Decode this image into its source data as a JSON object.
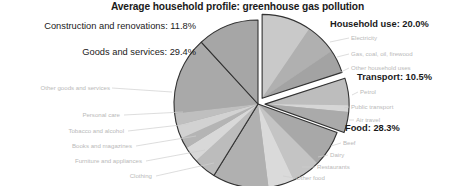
{
  "chart_data": {
    "type": "pie",
    "title": "Average household profile: greenhouse gas pollution",
    "xlabel": "",
    "ylabel": "",
    "legend_position": "none",
    "grid": false,
    "units": "percent",
    "categories": [
      "Household use",
      "Transport",
      "Food",
      "Goods and services",
      "Construction and renovations"
    ],
    "values": [
      20.0,
      10.5,
      28.3,
      29.4,
      11.8
    ],
    "slices": [
      {
        "name": "Household use",
        "label": "Household use: 20.0%",
        "value": 20.0,
        "exploded": true,
        "color": "#b8b8b8",
        "sub": [
          {
            "name": "Electricity",
            "label": "Electricity",
            "value": 9.5,
            "color": "#c9c9c9"
          },
          {
            "name": "Gas, coal, oil, firewood",
            "label": "Gas, coal, oil, firewood",
            "value": 6.0,
            "color": "#b0b0b0"
          },
          {
            "name": "Other household uses",
            "label": "Other household uses",
            "value": 4.5,
            "color": "#a3a3a3"
          }
        ]
      },
      {
        "name": "Transport",
        "label": "Transport: 10.5%",
        "value": 10.5,
        "exploded": true,
        "color": "#b4b4b4",
        "sub": [
          {
            "name": "Petrol",
            "label": "Petrol",
            "value": 5.2,
            "color": "#bdbdbd"
          },
          {
            "name": "Public transport",
            "label": "Public transport",
            "value": 1.3,
            "color": "#d6d6d6"
          },
          {
            "name": "Air travel",
            "label": "Air travel",
            "value": 4.0,
            "color": "#aaaaaa"
          }
        ]
      },
      {
        "name": "Food",
        "label": "Food: 28.3%",
        "value": 28.3,
        "exploded": false,
        "color": "#b2b2b2",
        "sub": [
          {
            "name": "Beef",
            "label": "Beef",
            "value": 7.0,
            "color": "#a8a8a8"
          },
          {
            "name": "Dairy",
            "label": "Dairy",
            "value": 5.5,
            "color": "#c4c4c4"
          },
          {
            "name": "Restaurants",
            "label": "Restaurants",
            "value": 5.0,
            "color": "#dadada"
          },
          {
            "name": "Other food",
            "label": "Other food",
            "value": 10.8,
            "color": "#b0b0b0"
          }
        ]
      },
      {
        "name": "Goods and services",
        "label": "Goods and services: 29.4%",
        "value": 29.4,
        "exploded": false,
        "color": "#aeaeae",
        "sub": [
          {
            "name": "Clothing",
            "label": "Clothing",
            "value": 4.4,
            "color": "#bcbcbc"
          },
          {
            "name": "Furniture and appliances",
            "label": "Furniture and appliances",
            "value": 3.0,
            "color": "#d8d8d8"
          },
          {
            "name": "Books and magazines",
            "label": "Books and magazines",
            "value": 2.1,
            "color": "#b4b4b4"
          },
          {
            "name": "Tobacco and alcohol",
            "label": "Tobacco and alcohol",
            "value": 2.6,
            "color": "#d2d2d2"
          },
          {
            "name": "Personal care",
            "label": "Personal care",
            "value": 2.3,
            "color": "#bfbfbf"
          },
          {
            "name": "Other goods and services",
            "label": "Other goods and services",
            "value": 15.0,
            "color": "#a9a9a9"
          }
        ]
      },
      {
        "name": "Construction and renovations",
        "label": "Construction and renovations: 11.8%",
        "value": 11.8,
        "exploded": false,
        "color": "#a6a6a6",
        "sub": []
      }
    ],
    "colors": {
      "outline": "#333333",
      "title_text": "#1a1a1a",
      "main_label_text": "#1a1a1a",
      "sub_label_text": "#b9b9b9",
      "background": "#ffffff"
    }
  },
  "labels": {
    "construction": "Construction and renovations: 11.8%",
    "goods": "Goods and services: 29.4%",
    "household": "Household use: 20.0%",
    "transport": "Transport: 10.5%",
    "food": "Food: 28.3%",
    "other_goods_and_services": "Other goods and services",
    "personal_care": "Personal care",
    "tobacco_and_alcohol": "Tobacco and alcohol",
    "books_and_magazines": "Books and magazines",
    "furniture_and_appliances": "Furniture and appliances",
    "clothing": "Clothing",
    "electricity": "Electricity",
    "gas_coal_oil_firewood": "Gas, coal, oil, firewood",
    "other_household_uses": "Other household uses",
    "petrol": "Petrol",
    "public_transport": "Public transport",
    "air_travel": "Air travel",
    "beef": "Beef",
    "dairy": "Dairy",
    "restaurants": "Restaurants",
    "other_food": "Other food"
  }
}
